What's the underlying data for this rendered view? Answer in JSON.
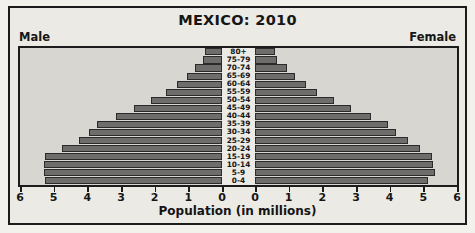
{
  "chart_data": {
    "type": "bar",
    "subtype": "population-pyramid",
    "title": "MEXICO: 2010",
    "xlabel": "Population (in millions)",
    "ylabel": "",
    "left_label": "Male",
    "right_label": "Female",
    "categories": [
      "80+",
      "75-79",
      "70-74",
      "65-69",
      "60-64",
      "55-59",
      "50-54",
      "45-49",
      "40-44",
      "35-39",
      "30-34",
      "25-29",
      "20-24",
      "15-19",
      "10-14",
      "5-9",
      "0-4"
    ],
    "series": [
      {
        "name": "Male",
        "values": [
          0.5,
          0.55,
          0.8,
          1.05,
          1.35,
          1.65,
          2.1,
          2.6,
          3.15,
          3.7,
          3.95,
          4.25,
          4.75,
          5.25,
          5.3,
          5.3,
          5.25
        ]
      },
      {
        "name": "Female",
        "values": [
          0.6,
          0.65,
          0.95,
          1.2,
          1.5,
          1.85,
          2.35,
          2.85,
          3.45,
          3.95,
          4.2,
          4.55,
          4.9,
          5.25,
          5.3,
          5.35,
          5.15
        ]
      }
    ],
    "xlim": [
      0,
      6
    ],
    "xticks": [
      0,
      1,
      2,
      3,
      4,
      5,
      6
    ],
    "left_tick_labels": [
      "6",
      "5",
      "4",
      "3",
      "2",
      "1",
      "0"
    ],
    "right_tick_labels": [
      "0",
      "1",
      "2",
      "3",
      "4",
      "5",
      "6"
    ],
    "grid": false,
    "legend_position": "none",
    "bar_color": "#6e6d6b",
    "plot_background": "#d8d6d0",
    "figure_background": "#eceae4",
    "border_color": "#1c1c1c"
  }
}
